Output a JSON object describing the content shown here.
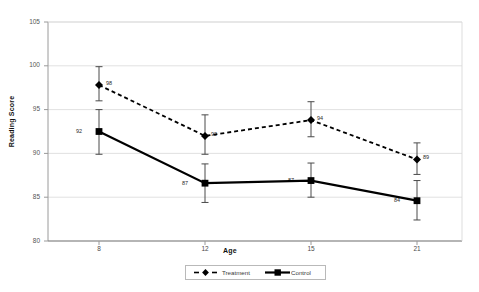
{
  "chart_data": {
    "type": "line",
    "title": "",
    "xlabel": "Age",
    "ylabel": "Reading Score",
    "x": [
      8,
      12,
      15,
      21
    ],
    "xtick_labels": [
      "8",
      "12",
      "15",
      "21"
    ],
    "ytick_labels": [
      "80",
      "85",
      "90",
      "95",
      "100",
      "105"
    ],
    "ylim": [
      80,
      105
    ],
    "yticks": [
      80,
      85,
      90,
      95,
      100,
      105
    ],
    "grid": true,
    "grid_axis": "y",
    "legend_position": "bottom-center",
    "errorbars": true,
    "series": [
      {
        "name": "Treatment",
        "linestyle": "dashed",
        "marker": "diamond",
        "color": "#000000",
        "values": [
          97.8,
          92.0,
          93.8,
          89.3
        ],
        "data_labels": [
          "98",
          "92",
          "94",
          "89"
        ],
        "err_low": [
          96.0,
          89.9,
          91.9,
          87.6
        ],
        "err_high": [
          99.9,
          94.4,
          95.9,
          91.2
        ]
      },
      {
        "name": "Control",
        "linestyle": "solid",
        "marker": "square",
        "color": "#000000",
        "values": [
          92.5,
          86.6,
          86.9,
          84.6
        ],
        "data_labels": [
          "92",
          "87",
          "87",
          "84"
        ],
        "err_low": [
          89.9,
          84.4,
          85.0,
          82.4
        ],
        "err_high": [
          95.0,
          88.8,
          88.9,
          86.9
        ]
      }
    ]
  },
  "legend": {
    "items": [
      {
        "label": "Treatment",
        "marker": "diamond",
        "linestyle": "dashed"
      },
      {
        "label": "Control",
        "marker": "square",
        "linestyle": "solid"
      }
    ]
  },
  "colors": {
    "series": "#000000",
    "grid": "#d9d9d9",
    "axis": "#9a9a9a",
    "plot_background": "#ffffff",
    "page_background": "#ffffff"
  }
}
